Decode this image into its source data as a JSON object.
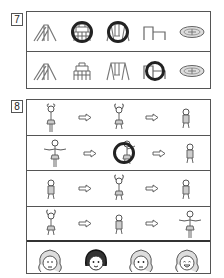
{
  "questions": [
    {
      "number": "7",
      "rows": [
        {
          "items": [
            {
              "icon": "slide-icon",
              "circled": false
            },
            {
              "icon": "jungle-gym-icon",
              "circled": true
            },
            {
              "icon": "swing-icon",
              "circled": true
            },
            {
              "icon": "horizontal-bar-icon",
              "circled": false
            },
            {
              "icon": "merry-go-round-icon",
              "circled": false
            }
          ]
        },
        {
          "items": [
            {
              "icon": "slide-icon",
              "circled": false
            },
            {
              "icon": "jungle-gym-icon",
              "circled": false
            },
            {
              "icon": "swing-icon",
              "circled": false
            },
            {
              "icon": "horizontal-bar-icon",
              "circled": true
            },
            {
              "icon": "merry-go-round-icon",
              "circled": false
            }
          ]
        }
      ]
    },
    {
      "number": "8",
      "rows": [
        {
          "poses": [
            "arms-up",
            "arms-up-squat",
            "crouch"
          ],
          "circled_index": -1
        },
        {
          "poses": [
            "arms-out",
            "arms-up-squat",
            "crouch"
          ],
          "circled_index": 1
        },
        {
          "poses": [
            "crouch",
            "arms-up-squat",
            "crouch"
          ],
          "circled_index": -1
        },
        {
          "poses": [
            "arms-up-squat",
            "crouch",
            "arms-out"
          ],
          "circled_index": -1
        }
      ],
      "faces": [
        {
          "expression": "crying",
          "circled": false
        },
        {
          "expression": "plain-dark-hair",
          "circled": true
        },
        {
          "expression": "worried",
          "circled": false
        },
        {
          "expression": "laughing",
          "circled": false
        }
      ]
    }
  ],
  "colors": {
    "line": "#555555",
    "ink": "#222222",
    "paper": "#ffffff"
  }
}
